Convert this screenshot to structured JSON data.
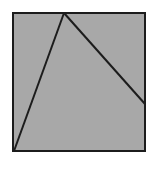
{
  "figure": {
    "canvas": {
      "width": 157,
      "height": 174,
      "background": "#ffffff"
    },
    "colors": {
      "fill": "#a8a8a8",
      "stroke": "#1c1c1c",
      "background": "#ffffff"
    },
    "square": {
      "name": "gray-square",
      "left": 13,
      "top": 13,
      "right": 145,
      "bottom": 151,
      "width": 132,
      "height": 138,
      "fill": "#a8a8a8",
      "stroke": "#1c1c1c",
      "stroke_width": 2
    },
    "points": {
      "top_left": {
        "label": "top-left-corner",
        "x": 13,
        "y": 13
      },
      "top_right": {
        "label": "top-right-corner",
        "x": 145,
        "y": 13
      },
      "bottom_right": {
        "label": "bottom-right-corner",
        "x": 145,
        "y": 151
      },
      "bottom_left": {
        "label": "bottom-left-corner",
        "x": 13,
        "y": 151
      },
      "apex": {
        "label": "apex-on-top-edge",
        "x": 64,
        "y": 13
      },
      "right_edge_point": {
        "label": "point-on-right-edge",
        "x": 145,
        "y": 104
      }
    },
    "segments": [
      {
        "name": "segment-apex-to-bottom-left",
        "x1": 64,
        "y1": 13,
        "x2": 14,
        "y2": 151,
        "stroke": "#1c1c1c",
        "stroke_width": 2
      },
      {
        "name": "segment-apex-to-right-edge",
        "x1": 64,
        "y1": 13,
        "x2": 145,
        "y2": 104,
        "stroke": "#1c1c1c",
        "stroke_width": 2
      }
    ],
    "regions": [
      {
        "name": "region-left-triangle",
        "vertices": "13,13 64,13 14,151"
      },
      {
        "name": "region-middle-triangle",
        "vertices": "64,13 145,104 145,151 14,151"
      },
      {
        "name": "region-right-triangle",
        "vertices": "64,13 145,13 145,104"
      }
    ]
  }
}
